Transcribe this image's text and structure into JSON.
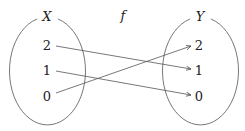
{
  "diagram": {
    "function_label": "f",
    "domain": {
      "label": "X",
      "elements": [
        "2",
        "1",
        "0"
      ]
    },
    "codomain": {
      "label": "Y",
      "elements": [
        "2",
        "1",
        "0"
      ]
    },
    "mappings": [
      {
        "from": "2",
        "to": "1"
      },
      {
        "from": "1",
        "to": "0"
      },
      {
        "from": "0",
        "to": "2"
      }
    ],
    "colors": {
      "stroke": "#555555",
      "text": "#222222",
      "background": "#ffffff"
    }
  }
}
